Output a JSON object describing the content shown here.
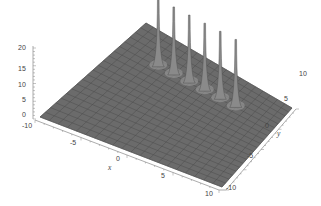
{
  "chart_data": {
    "type": "surface3d",
    "title": "",
    "xlabel": "x",
    "ylabel": "y",
    "zlabel": "",
    "xlim": [
      -10,
      10
    ],
    "ylim": [
      -10,
      10
    ],
    "zlim": [
      0,
      20
    ],
    "x_ticks": [
      "-10",
      "-5",
      "0",
      "5",
      "10"
    ],
    "y_ticks": [
      "-10",
      "-5",
      "0",
      "5",
      "10"
    ],
    "z_ticks": [
      "0",
      "5",
      "10",
      "15",
      "20"
    ],
    "surface": "flat plane near z=0 with a row of sharp narrow spikes",
    "peaks": [
      {
        "x": -5,
        "y": 5,
        "height": 20
      },
      {
        "x": -3,
        "y": 5,
        "height": 20
      },
      {
        "x": -1,
        "y": 5,
        "height": 20
      },
      {
        "x": 1,
        "y": 5,
        "height": 20
      },
      {
        "x": 3,
        "y": 5,
        "height": 20
      },
      {
        "x": 5,
        "y": 5,
        "height": 20
      }
    ],
    "colors": {
      "surface": "#6e6e6e",
      "mesh": "#4a4a4a",
      "highlight": "#9a9a9a",
      "axes": "#777777"
    },
    "grid": false,
    "legend": null
  }
}
